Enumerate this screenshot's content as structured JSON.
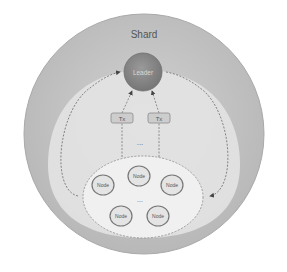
{
  "diagram": {
    "shard_label": "Shard",
    "leader_label": "Leader",
    "tx_labels": [
      "Tx",
      "Tx"
    ],
    "tx_ellipsis": "...",
    "node_ellipsis": "...",
    "nodes": [
      "Node",
      "Node",
      "Node",
      "Node",
      "Node"
    ]
  },
  "colors": {
    "outer_shard": "#bdbdbd",
    "inner_region": "#e6e6e6",
    "node_pool": "#f1f1f1",
    "leader_fill": "#8a8a8a",
    "tx_fill": "#cfcfcf",
    "node_stroke": "#7a7a7a",
    "arrow": "#555555"
  }
}
